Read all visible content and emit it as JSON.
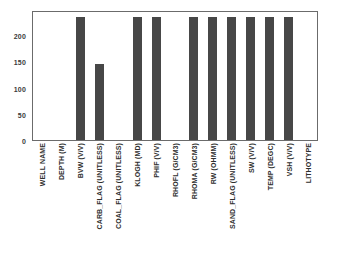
{
  "chart_data": {
    "type": "bar",
    "title": "",
    "subtitle": "",
    "xlabel": "",
    "ylabel": "",
    "ylim": [
      0,
      248
    ],
    "yticks": [
      0,
      50,
      100,
      150,
      200
    ],
    "ytick_labels": [
      "0",
      "50",
      "100",
      "150",
      "200"
    ],
    "grid": false,
    "legend": null,
    "bar_color": "#474747",
    "axis_color": "#6b6b6b",
    "categories": [
      "WELL NAME",
      "DEPTH (M)",
      "BVW (V/V)",
      "CARB_FLAG (UNITLESS)",
      "COAL_FLAG (UNITLESS)",
      "KLOGH (MD)",
      "PHIF (V/V)",
      "RHOFL (G/CM3)",
      "RHOMA (G/CM3)",
      "RW (OHMM)",
      "SAND_FLAG (UNITLESS)",
      "SW (V/V)",
      "TEMP (DEGC)",
      "VSH (V/V)",
      "LITHOTYPE"
    ],
    "values": [
      0,
      0,
      235,
      145,
      0,
      235,
      235,
      0,
      235,
      235,
      235,
      235,
      235,
      235,
      0
    ]
  }
}
